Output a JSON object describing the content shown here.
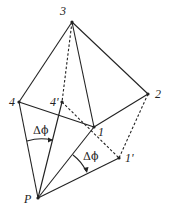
{
  "diagram": {
    "colors": {
      "line": "#222222",
      "background": "#ffffff"
    },
    "points": {
      "P": {
        "label": "P",
        "x": 38,
        "y": 198
      },
      "1": {
        "label": "1",
        "x": 94,
        "y": 127
      },
      "2": {
        "label": "2",
        "x": 148,
        "y": 94
      },
      "3": {
        "label": "3",
        "x": 72,
        "y": 22
      },
      "4": {
        "label": "4",
        "x": 19,
        "y": 102
      },
      "4p": {
        "label": "4'",
        "x": 62,
        "y": 102
      },
      "1p": {
        "label": "1'",
        "x": 119,
        "y": 158
      }
    },
    "solid_edges": [
      [
        "3",
        "4"
      ],
      [
        "3",
        "2"
      ],
      [
        "3",
        "1"
      ],
      [
        "4",
        "1"
      ],
      [
        "1",
        "2"
      ],
      [
        "P",
        "4"
      ],
      [
        "P",
        "4p"
      ],
      [
        "P",
        "1"
      ],
      [
        "P",
        "1p"
      ]
    ],
    "dashed_edges": [
      [
        "3",
        "4p"
      ],
      [
        "4p",
        "1p"
      ],
      [
        "2",
        "1p"
      ]
    ],
    "angle_labels": [
      {
        "text": "Δϕ",
        "x": 34,
        "y": 134
      },
      {
        "text": "Δϕ",
        "x": 84,
        "y": 160
      }
    ]
  }
}
